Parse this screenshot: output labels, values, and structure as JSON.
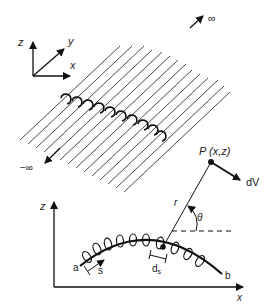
{
  "figure": {
    "top_panel": {
      "axes": {
        "z": "z",
        "y": "y",
        "x": "x"
      },
      "plus_infinity": "∞",
      "minus_infinity": "−∞",
      "parallel_line_count": 14,
      "description": "Array of parallel infinite wires running diagonally with loops along a line"
    },
    "bottom_panel": {
      "axes": {
        "z": "z",
        "x": "x"
      },
      "point_label": "P (x,z)",
      "field_label": "dV",
      "r_label": "r",
      "theta_label": "θ",
      "ds_label": "d",
      "ds_sub": "s",
      "start_label": "a",
      "end_label": "b",
      "path_label": "s"
    }
  }
}
